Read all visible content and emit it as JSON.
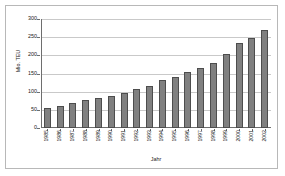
{
  "chart_data": {
    "type": "bar",
    "title": "",
    "xlabel": "Jahr",
    "ylabel": "Mio. TEU",
    "ylim": [
      0,
      300
    ],
    "yticks": [
      0,
      50,
      100,
      150,
      200,
      250,
      300
    ],
    "grid": true,
    "legend": "none",
    "bar_color": "#808080",
    "bar_border_color": "#4d4d4d",
    "categories": [
      "1985",
      "1986",
      "1987",
      "1988",
      "1989",
      "1990",
      "1991",
      "1992",
      "1993",
      "1994",
      "1995",
      "1996",
      "1997",
      "1998",
      "1999",
      "2000",
      "2001",
      "2002"
    ],
    "values": [
      56,
      61,
      68,
      76,
      83,
      89,
      96,
      107,
      117,
      131,
      140,
      153,
      165,
      180,
      205,
      235,
      247,
      270
    ]
  }
}
